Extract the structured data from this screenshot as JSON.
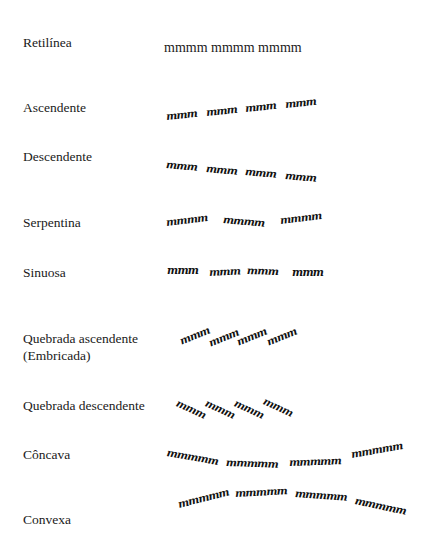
{
  "rows": [
    {
      "label": "Retilínea",
      "words": [
        "mmmm",
        "mmmm",
        "mmmm"
      ]
    },
    {
      "label": "Ascendente",
      "words": [
        "mmm",
        "mmm",
        "mmm",
        "mmm"
      ]
    },
    {
      "label": "Descendente",
      "words": [
        "mmm",
        "mmm",
        "mmm",
        "mmm"
      ]
    },
    {
      "label": "Serpentina",
      "words": [
        "mmmm",
        "mmmm",
        "mmmm"
      ]
    },
    {
      "label": "Sinuosa",
      "words": [
        "mmm",
        "mmm",
        "mmm",
        "mmm"
      ]
    },
    {
      "label": "Quebrada ascendente",
      "label2": "(Embricada)",
      "words": [
        "mmm",
        "mmm",
        "mmm",
        "mmm"
      ]
    },
    {
      "label": "Quebrada descendente",
      "words": [
        "mmm",
        "mmm",
        "mmm",
        "mmm"
      ]
    },
    {
      "label": "Côncava",
      "words": [
        "mmmmm",
        "mmmmm",
        "mmmmm",
        "mmmmm"
      ]
    },
    {
      "label": "Convexa",
      "words": [
        "mmmmm",
        "mmmmm",
        "mmmmm",
        "mmmmm"
      ]
    }
  ],
  "retilinea_text": "mmmm mmmm mmmm"
}
